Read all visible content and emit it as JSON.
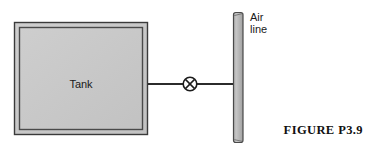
{
  "figure": {
    "caption": "FIGURE  P3.9",
    "background_color": "#ffffff"
  },
  "tank": {
    "label": "Tank",
    "fill_color": "#c8c8c8",
    "border_color": "#3a3a3a",
    "inner_border_color": "#4a4a4a",
    "x": 14,
    "y": 22,
    "width": 134,
    "height": 113
  },
  "pipe": {
    "label": "",
    "color": "#2b2b2b",
    "start_x": 148,
    "end_x": 234,
    "y": 84
  },
  "valve": {
    "icon": "crossed-circle-valve-icon",
    "label": "",
    "color": "#1c1c1c",
    "center_x": 190,
    "center_y": 84,
    "radius": 7
  },
  "air_line": {
    "label_line1": "Air",
    "label_line2": "line",
    "fill_color": "#b9b9b9",
    "border_color": "#4a4a4a",
    "x": 233,
    "y": 12,
    "width": 10,
    "height": 131
  }
}
